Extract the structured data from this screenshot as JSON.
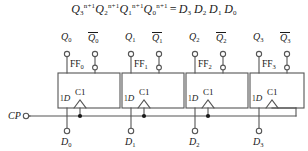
{
  "figure": {
    "title_equation": {
      "lhs_terms": [
        "Q3",
        "Q2",
        "Q1",
        "Q0"
      ],
      "exponent": "n+1",
      "operator": "=",
      "rhs_terms": [
        "D3",
        "D2",
        "D1",
        "D0"
      ],
      "plain": "Q3^n+1 Q2^n+1 Q1^n+1 Q0^n+1 = D3 D2 D1 D0"
    },
    "clock": {
      "label": "CP",
      "terminal": "open-circle"
    },
    "flipflops": [
      {
        "name": "FF0",
        "label_base": "FF",
        "label_sub": "0",
        "d_input_pin": "1D",
        "c_input_pin": "C1",
        "q_label_base": "Q",
        "q_label_sub": "0",
        "qbar_label_base": "Q",
        "qbar_label_sub": "0",
        "data_label_base": "D",
        "data_label_sub": "0"
      },
      {
        "name": "FF1",
        "label_base": "FF",
        "label_sub": "1",
        "d_input_pin": "1D",
        "c_input_pin": "C1",
        "q_label_base": "Q",
        "q_label_sub": "1",
        "qbar_label_base": "Q",
        "qbar_label_sub": "1",
        "data_label_base": "D",
        "data_label_sub": "1"
      },
      {
        "name": "FF2",
        "label_base": "FF",
        "label_sub": "2",
        "d_input_pin": "1D",
        "c_input_pin": "C1",
        "q_label_base": "Q",
        "q_label_sub": "2",
        "qbar_label_base": "Q",
        "qbar_label_sub": "2",
        "data_label_base": "D",
        "data_label_sub": "2"
      },
      {
        "name": "FF3",
        "label_base": "FF",
        "label_sub": "3",
        "d_input_pin": "1D",
        "c_input_pin": "C1",
        "q_label_base": "Q",
        "q_label_sub": "3",
        "qbar_label_base": "Q",
        "qbar_label_sub": "3",
        "data_label_base": "D",
        "data_label_sub": "3"
      }
    ],
    "colors": {
      "ink": "#1a1a1a",
      "line": "#555555",
      "background": "#ffffff"
    }
  }
}
